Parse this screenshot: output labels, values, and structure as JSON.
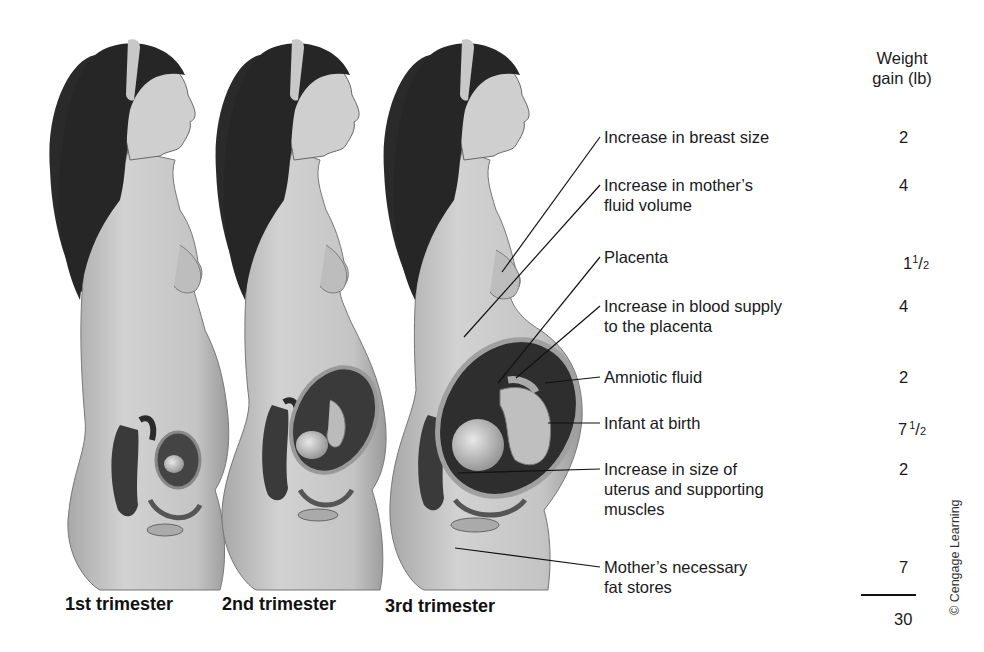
{
  "figure": {
    "captions": [
      "1st trimester",
      "2nd trimester",
      "3rd trimester"
    ],
    "column_header": {
      "line1": "Weight",
      "line2": "gain (lb)"
    },
    "components": [
      {
        "label_lines": [
          "Increase in breast size"
        ],
        "value": "2"
      },
      {
        "label_lines": [
          "Increase in mother’s",
          "fluid volume"
        ],
        "value": "4"
      },
      {
        "label_lines": [
          "Placenta"
        ],
        "value_whole": "1",
        "value_num": "1",
        "value_den": "2",
        "value": "1 1/2"
      },
      {
        "label_lines": [
          "Increase in blood supply",
          "to the placenta"
        ],
        "value": "4"
      },
      {
        "label_lines": [
          "Amniotic fluid"
        ],
        "value": "2"
      },
      {
        "label_lines": [
          "Infant at birth"
        ],
        "value_whole": "7",
        "value_num": "1",
        "value_den": "2",
        "value": "7 1/2"
      },
      {
        "label_lines": [
          "Increase in size of",
          "uterus and supporting",
          "muscles"
        ],
        "value": "2"
      },
      {
        "label_lines": [
          "Mother’s necessary",
          "fat stores"
        ],
        "value": "7"
      }
    ],
    "total": "30",
    "credit": "© Cengage Learning"
  },
  "colors": {
    "skin": "#c9c9c9",
    "skin_shadow": "#9e9e9e",
    "hair": "#2a2a2a",
    "interior": "#3a3a3a",
    "line": "#111111"
  }
}
